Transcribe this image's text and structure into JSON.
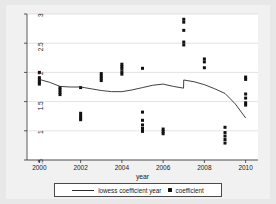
{
  "chart_data": {
    "type": "scatter",
    "title": "",
    "xlabel": "year",
    "ylabel": "",
    "xlim": [
      1999.4,
      2010.6
    ],
    "ylim": [
      0.5,
      3.0
    ],
    "grid": true,
    "grid_axis": "y",
    "legend_position": "bottom",
    "xticks": [
      2000,
      2002,
      2004,
      2006,
      2008,
      2010
    ],
    "xtick_labels": [
      "2000",
      "2002",
      "2004",
      "2006",
      "2008",
      "2010"
    ],
    "yticks": [
      0.5,
      1,
      1.5,
      2,
      2.5,
      3
    ],
    "ytick_labels": [
      ".5",
      "1",
      "1.5",
      "2",
      "2.5",
      "3"
    ],
    "series": [
      {
        "name": "coefficient",
        "type": "scatter",
        "marker": "square",
        "color": "#111111",
        "points": [
          {
            "x": 2000,
            "y": 2.0
          },
          {
            "x": 2000,
            "y": 1.91
          },
          {
            "x": 2000,
            "y": 1.87
          },
          {
            "x": 2000,
            "y": 1.83
          },
          {
            "x": 2000,
            "y": 1.8
          },
          {
            "x": 2001,
            "y": 1.74
          },
          {
            "x": 2001,
            "y": 1.7
          },
          {
            "x": 2001,
            "y": 1.66
          },
          {
            "x": 2001,
            "y": 1.62
          },
          {
            "x": 2002,
            "y": 1.74
          },
          {
            "x": 2002,
            "y": 1.3
          },
          {
            "x": 2002,
            "y": 1.26
          },
          {
            "x": 2002,
            "y": 1.22
          },
          {
            "x": 2002,
            "y": 1.19
          },
          {
            "x": 2003,
            "y": 1.98
          },
          {
            "x": 2003,
            "y": 1.94
          },
          {
            "x": 2003,
            "y": 1.9
          },
          {
            "x": 2003,
            "y": 1.86
          },
          {
            "x": 2004,
            "y": 2.14
          },
          {
            "x": 2004,
            "y": 2.1
          },
          {
            "x": 2004,
            "y": 2.06
          },
          {
            "x": 2004,
            "y": 2.01
          },
          {
            "x": 2004,
            "y": 1.97
          },
          {
            "x": 2005,
            "y": 2.07
          },
          {
            "x": 2005,
            "y": 1.32
          },
          {
            "x": 2005,
            "y": 1.18
          },
          {
            "x": 2005,
            "y": 1.1
          },
          {
            "x": 2005,
            "y": 1.04
          },
          {
            "x": 2005,
            "y": 0.99
          },
          {
            "x": 2006,
            "y": 1.03
          },
          {
            "x": 2006,
            "y": 0.99
          },
          {
            "x": 2006,
            "y": 0.95
          },
          {
            "x": 2007,
            "y": 2.91
          },
          {
            "x": 2007,
            "y": 2.86
          },
          {
            "x": 2007,
            "y": 2.72
          },
          {
            "x": 2007,
            "y": 2.52
          },
          {
            "x": 2007,
            "y": 2.47
          },
          {
            "x": 2008,
            "y": 2.23
          },
          {
            "x": 2008,
            "y": 2.18
          },
          {
            "x": 2008,
            "y": 2.08
          },
          {
            "x": 2009,
            "y": 1.06
          },
          {
            "x": 2009,
            "y": 0.97
          },
          {
            "x": 2009,
            "y": 0.91
          },
          {
            "x": 2009,
            "y": 0.85
          },
          {
            "x": 2009,
            "y": 0.79
          },
          {
            "x": 2010,
            "y": 1.92
          },
          {
            "x": 2010,
            "y": 1.88
          },
          {
            "x": 2010,
            "y": 1.63
          },
          {
            "x": 2010,
            "y": 1.56
          },
          {
            "x": 2010,
            "y": 1.48
          },
          {
            "x": 2010,
            "y": 1.44
          }
        ]
      },
      {
        "name": "lowess coefficient year",
        "type": "line",
        "color": "#2b2b2b",
        "x": [
          2000,
          2000.5,
          2001,
          2001.5,
          2002,
          2002.5,
          2003,
          2003.5,
          2004,
          2004.5,
          2005,
          2005.5,
          2006,
          2006.5,
          2006.99,
          2007,
          2007.5,
          2008,
          2008.5,
          2009,
          2009.5,
          2010
        ],
        "y": [
          1.88,
          1.83,
          1.76,
          1.75,
          1.75,
          1.72,
          1.69,
          1.67,
          1.67,
          1.7,
          1.74,
          1.78,
          1.8,
          1.76,
          1.73,
          1.87,
          1.84,
          1.79,
          1.72,
          1.64,
          1.46,
          1.22
        ]
      }
    ]
  },
  "legend": {
    "entries": [
      {
        "label": "lowess coefficient year",
        "marker": "line"
      },
      {
        "label": "coefficient",
        "marker": "square-dot"
      }
    ]
  }
}
